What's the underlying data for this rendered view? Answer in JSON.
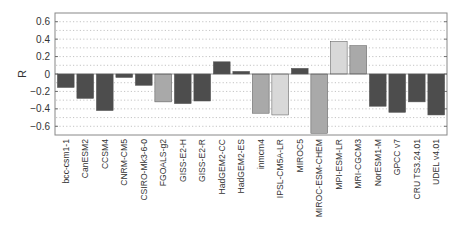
{
  "chart_data": {
    "type": "bar",
    "title": "",
    "xlabel": "",
    "ylabel": "R",
    "ylim": [
      -0.7,
      0.7
    ],
    "yticks": [
      0.6,
      0.4,
      0.2,
      0,
      -0.2,
      -0.4,
      -0.6
    ],
    "ytick_labels": [
      "0.6",
      "0.4",
      "0.2",
      "0",
      "−0.2",
      "−0.4",
      "−0.6"
    ],
    "grid": "horizontal-dotted",
    "categories": [
      "bcc-csm1-1",
      "CanESM2",
      "CCSM4",
      "CNRM-CM5",
      "CSIRO-Mk3-6-0",
      "FGOALS-g2",
      "GISS-E2-H",
      "GISS-E2-R",
      "HadGEM2-CC",
      "HadGEM2-ES",
      "inmcm4",
      "IPSL-CM5A-LR",
      "MIROC5",
      "MIROC-ESM-CHEM",
      "MPI-ESM-LR",
      "MRI-CGCM3",
      "NorESM1-M",
      "GPCC v7",
      "CRU TS3.24.01",
      "UDEL v4.01"
    ],
    "values": [
      -0.155,
      -0.28,
      -0.42,
      -0.04,
      -0.13,
      -0.32,
      -0.34,
      -0.31,
      0.14,
      0.03,
      -0.45,
      -0.47,
      0.065,
      -0.68,
      0.375,
      0.325,
      -0.37,
      -0.44,
      -0.32,
      -0.47
    ],
    "bar_shades": [
      "dark",
      "dark",
      "dark",
      "dark",
      "dark",
      "medium",
      "dark",
      "dark",
      "dark",
      "dark",
      "medium",
      "light",
      "dark",
      "medium",
      "light",
      "medium",
      "dark",
      "dark",
      "dark",
      "dark"
    ],
    "colors": {
      "dark": "#4d4d4d",
      "medium": "#a9a9a9",
      "light": "#d8d8d8",
      "edge": "#555555"
    }
  }
}
